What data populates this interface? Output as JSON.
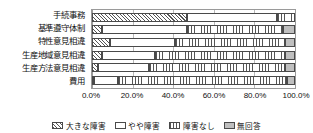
{
  "chart_data": {
    "type": "bar",
    "orientation": "horizontal",
    "stacked": true,
    "title": "",
    "xlabel": "",
    "ylabel": "",
    "xlim": [
      0,
      100
    ],
    "grid": true,
    "legend_position": "bottom",
    "categories": [
      "手続事務",
      "基準遵守体制",
      "特性意見相違",
      "生産地域意見相違",
      "生産方法意見相違",
      "費用"
    ],
    "xticks": [
      "0.0%",
      "20.0%",
      "40.0%",
      "60.0%",
      "80.0%",
      "100.0%"
    ],
    "xtick_values": [
      0,
      20,
      40,
      60,
      80,
      100
    ],
    "series": [
      {
        "name": "大きな障害",
        "pattern": "hatch",
        "values": [
          47.0,
          5.0,
          9.0,
          5.0,
          3.0,
          1.0
        ]
      },
      {
        "name": "やや障害",
        "pattern": "dots",
        "values": [
          44.0,
          42.0,
          32.0,
          26.0,
          25.0,
          12.0
        ]
      },
      {
        "name": "障害なし",
        "pattern": "vertical",
        "values": [
          9.0,
          47.0,
          54.0,
          64.0,
          67.0,
          83.0
        ]
      },
      {
        "name": "無回答",
        "pattern": "gray",
        "values": [
          0.0,
          6.0,
          5.0,
          5.0,
          5.0,
          4.0
        ]
      }
    ],
    "legend": [
      {
        "label": "大きな障害",
        "pattern": "hatch"
      },
      {
        "label": "やや障害",
        "pattern": "dots"
      },
      {
        "label": "障害なし",
        "pattern": "vertical"
      },
      {
        "label": "無回答",
        "pattern": "gray"
      }
    ]
  }
}
